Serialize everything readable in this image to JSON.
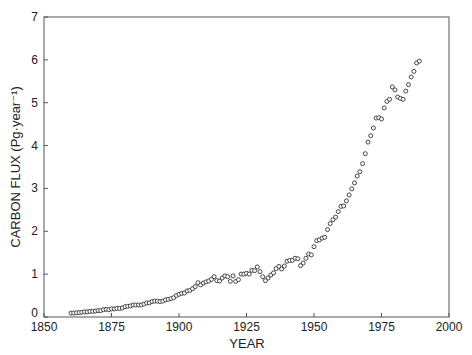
{
  "chart_data": {
    "type": "scatter",
    "title": "",
    "xlabel": "YEAR",
    "ylabel": "CARBON FLUX (Pg·year⁻¹)",
    "xlim": [
      1850,
      2000
    ],
    "ylim": [
      0,
      7
    ],
    "xticks": [
      1850,
      1875,
      1900,
      1925,
      1950,
      1975,
      2000
    ],
    "yticks": [
      0,
      1,
      2,
      3,
      4,
      5,
      6,
      7
    ],
    "grid": false,
    "legend": null,
    "marker": "open-circle",
    "series": [
      {
        "name": "Carbon flux",
        "x": [
          1860,
          1861,
          1862,
          1863,
          1864,
          1865,
          1866,
          1867,
          1868,
          1869,
          1870,
          1871,
          1872,
          1873,
          1874,
          1875,
          1876,
          1877,
          1878,
          1879,
          1880,
          1881,
          1882,
          1883,
          1884,
          1885,
          1886,
          1887,
          1888,
          1889,
          1890,
          1891,
          1892,
          1893,
          1894,
          1895,
          1896,
          1897,
          1898,
          1899,
          1900,
          1901,
          1902,
          1903,
          1904,
          1905,
          1906,
          1907,
          1908,
          1909,
          1910,
          1911,
          1912,
          1913,
          1914,
          1915,
          1916,
          1917,
          1918,
          1919,
          1920,
          1921,
          1922,
          1923,
          1924,
          1925,
          1926,
          1927,
          1928,
          1929,
          1930,
          1931,
          1932,
          1933,
          1934,
          1935,
          1936,
          1937,
          1938,
          1939,
          1940,
          1941,
          1942,
          1943,
          1944,
          1945,
          1946,
          1947,
          1948,
          1949,
          1950,
          1951,
          1952,
          1953,
          1954,
          1955,
          1956,
          1957,
          1958,
          1959,
          1960,
          1961,
          1962,
          1963,
          1964,
          1965,
          1966,
          1967,
          1968,
          1969,
          1970,
          1971,
          1972,
          1973,
          1974,
          1975,
          1976,
          1977,
          1978,
          1979,
          1980,
          1981,
          1982,
          1983,
          1984,
          1985,
          1986,
          1987,
          1988,
          1989
        ],
        "y": [
          0.09,
          0.09,
          0.1,
          0.1,
          0.11,
          0.12,
          0.12,
          0.13,
          0.13,
          0.14,
          0.15,
          0.15,
          0.17,
          0.18,
          0.17,
          0.19,
          0.19,
          0.2,
          0.2,
          0.21,
          0.24,
          0.25,
          0.26,
          0.28,
          0.28,
          0.28,
          0.28,
          0.3,
          0.33,
          0.33,
          0.36,
          0.37,
          0.37,
          0.36,
          0.37,
          0.4,
          0.41,
          0.43,
          0.45,
          0.5,
          0.53,
          0.55,
          0.56,
          0.61,
          0.62,
          0.66,
          0.71,
          0.8,
          0.75,
          0.79,
          0.82,
          0.84,
          0.88,
          0.94,
          0.85,
          0.84,
          0.91,
          0.96,
          0.94,
          0.83,
          0.96,
          0.83,
          0.87,
          1.0,
          1.0,
          1.02,
          1.0,
          1.09,
          1.08,
          1.17,
          1.06,
          0.94,
          0.85,
          0.91,
          0.98,
          1.03,
          1.13,
          1.18,
          1.12,
          1.19,
          1.3,
          1.32,
          1.32,
          1.37,
          1.36,
          1.2,
          1.26,
          1.37,
          1.47,
          1.45,
          1.64,
          1.78,
          1.8,
          1.84,
          1.86,
          2.04,
          2.18,
          2.27,
          2.33,
          2.46,
          2.58,
          2.59,
          2.71,
          2.85,
          2.99,
          3.13,
          3.29,
          3.39,
          3.58,
          3.81,
          4.08,
          4.23,
          4.41,
          4.64,
          4.65,
          4.62,
          4.88,
          5.03,
          5.08,
          5.37,
          5.3,
          5.13,
          5.1,
          5.08,
          5.27,
          5.42,
          5.6,
          5.73,
          5.93,
          5.97
        ]
      }
    ]
  }
}
